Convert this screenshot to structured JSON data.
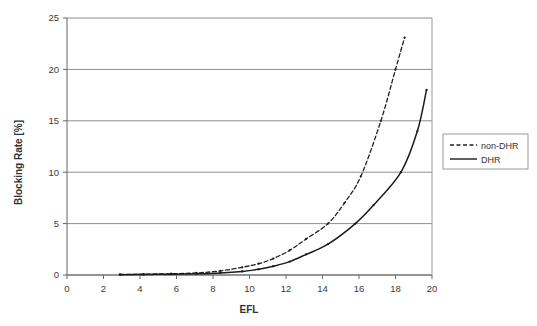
{
  "chart_data": {
    "type": "line",
    "title": "",
    "xlabel": "EFL",
    "ylabel": "Blocking Rate [%]",
    "xlim": [
      0,
      20
    ],
    "ylim": [
      0,
      25
    ],
    "xticks": [
      0,
      2,
      4,
      6,
      8,
      10,
      12,
      14,
      16,
      18,
      20
    ],
    "xtick_labels": [
      "0",
      "2",
      "4",
      "6",
      "8",
      "10",
      "12",
      "14",
      "16",
      "18",
      "20"
    ],
    "yticks": [
      0,
      5,
      10,
      15,
      20,
      25
    ],
    "ytick_labels": [
      "0",
      "5",
      "10",
      "15",
      "20",
      "25"
    ],
    "grid": "horizontal",
    "legend_position": "right-outside",
    "series": [
      {
        "name": "non-DHR",
        "style": "dashed",
        "color": "#222222",
        "markers": true,
        "x": [
          2.9,
          4.2,
          5.7,
          7.1,
          8.4,
          9.6,
          10.5,
          11.3,
          12.2,
          13.1,
          14.3,
          15.2,
          16.1,
          17.2,
          18.0,
          18.5
        ],
        "y": [
          0.05,
          0.08,
          0.12,
          0.2,
          0.4,
          0.75,
          1.1,
          1.6,
          2.4,
          3.5,
          5.0,
          7.0,
          9.6,
          15.0,
          20.0,
          23.1
        ]
      },
      {
        "name": "DHR",
        "style": "solid",
        "color": "#1a1a1a",
        "markers": true,
        "x": [
          2.9,
          4.2,
          5.7,
          7.1,
          8.4,
          9.6,
          10.5,
          11.3,
          12.2,
          13.1,
          14.3,
          15.8,
          16.8,
          18.3,
          19.2,
          19.7
        ],
        "y": [
          0.03,
          0.05,
          0.08,
          0.12,
          0.2,
          0.35,
          0.55,
          0.85,
          1.3,
          2.0,
          3.0,
          5.0,
          6.8,
          10.0,
          14.0,
          18.0
        ]
      }
    ]
  },
  "axes": {
    "y_title": "Blocking Rate [%]",
    "x_title": "EFL"
  },
  "legend": {
    "items": [
      {
        "label": "non-DHR",
        "style": "dashed"
      },
      {
        "label": "DHR",
        "style": "solid"
      }
    ]
  },
  "colors": {
    "grid": "#808080",
    "axis": "#555555",
    "series_primary": "#222222",
    "background": "#ffffff"
  }
}
